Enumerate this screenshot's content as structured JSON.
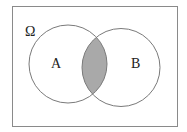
{
  "diagram": {
    "type": "venn",
    "universe_label": "Ω",
    "sets": [
      {
        "id": "A",
        "label": "A"
      },
      {
        "id": "B",
        "label": "B"
      }
    ],
    "shaded_region": "A ∩ B",
    "colors": {
      "stroke": "#7a7a7a",
      "shade": "#a9a9a9",
      "background": "#ffffff"
    }
  }
}
